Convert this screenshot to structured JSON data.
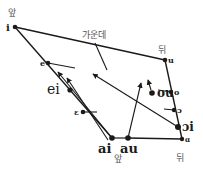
{
  "labels": {
    "front_top": "앞",
    "center": "가운데",
    "back_top": "뒤",
    "front_bottom": "앞",
    "back_bottom": "뒤"
  },
  "vowels": {
    "i": "i",
    "e": "e",
    "ei": "ei",
    "epsilon": "ɛ",
    "ai": "ai",
    "au": "au",
    "u": "u",
    "o": "o",
    "ou": "ou",
    "open_o": "ɔ",
    "oi": "ɔi",
    "a_back": "ɑ"
  },
  "colors": {
    "ink": "#1a1a1a",
    "label": "#555555",
    "background": "#ffffff"
  }
}
